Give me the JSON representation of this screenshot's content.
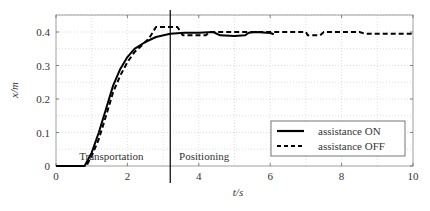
{
  "chart_data": {
    "type": "line",
    "title": "",
    "xlabel": "t/s",
    "ylabel": "x/m",
    "xlim": [
      0,
      10
    ],
    "ylim": [
      0,
      0.45
    ],
    "xticks": [
      0,
      2,
      4,
      6,
      8,
      10
    ],
    "xtick_labels": [
      "0",
      "2",
      "4",
      "6",
      "8",
      "10"
    ],
    "yticks": [
      0,
      0.1,
      0.2,
      0.3,
      0.4
    ],
    "ytick_labels": [
      "0",
      "0.1",
      "0.2",
      "0.3",
      "0.4"
    ],
    "grid": true,
    "legend_position": "lower right",
    "phase_divider_t": 3.2,
    "annotations": [
      {
        "text": "Transportation",
        "x": 1.55,
        "y": 0.02
      },
      {
        "text": "Positioning",
        "x": 4.15,
        "y": 0.02
      }
    ],
    "series": [
      {
        "name": "assistance ON",
        "style": "solid",
        "color": "#000000",
        "x": [
          0,
          0.8,
          1.0,
          1.2,
          1.4,
          1.6,
          1.8,
          2.0,
          2.2,
          2.5,
          2.8,
          3.2,
          3.6,
          4.0,
          4.4,
          4.6,
          5.0,
          5.3,
          5.4,
          5.6,
          6.0,
          6.1
        ],
        "y": [
          0,
          0,
          0.04,
          0.1,
          0.17,
          0.24,
          0.29,
          0.325,
          0.35,
          0.37,
          0.385,
          0.395,
          0.398,
          0.398,
          0.4,
          0.39,
          0.388,
          0.39,
          0.398,
          0.4,
          0.397,
          0.393
        ]
      },
      {
        "name": "assistance OFF",
        "style": "dashed",
        "color": "#000000",
        "x": [
          0,
          0.85,
          1.0,
          1.2,
          1.4,
          1.6,
          1.8,
          2.0,
          2.2,
          2.4,
          2.6,
          2.8,
          3.4,
          3.55,
          4.2,
          4.3,
          7.0,
          7.05,
          7.4,
          7.5,
          8.5,
          8.65,
          10
        ],
        "y": [
          0,
          0,
          0.03,
          0.08,
          0.15,
          0.22,
          0.27,
          0.31,
          0.34,
          0.36,
          0.38,
          0.415,
          0.415,
          0.39,
          0.39,
          0.4,
          0.4,
          0.39,
          0.39,
          0.4,
          0.4,
          0.395,
          0.395
        ]
      }
    ]
  }
}
